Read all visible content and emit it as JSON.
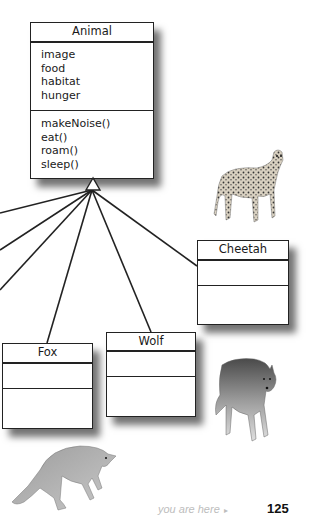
{
  "diagram": {
    "type": "UML class inheritance diagram",
    "superclass": {
      "name": "Animal",
      "attributes": [
        "image",
        "food",
        "habitat",
        "hunger"
      ],
      "methods": [
        "makeNoise()",
        "eat()",
        "roam()",
        "sleep()"
      ]
    },
    "subclasses": [
      {
        "name": "Cheetah",
        "attributes": [],
        "methods": []
      },
      {
        "name": "Fox",
        "attributes": [],
        "methods": []
      },
      {
        "name": "Wolf",
        "attributes": [],
        "methods": []
      }
    ],
    "offscreen_subclass_links": 3,
    "inheritance_arrow": "hollow-triangle"
  },
  "images": {
    "cheetah": "cheetah-photo",
    "wolf": "wolf-photo",
    "fox": "fox-photo"
  },
  "footer": {
    "you_are_here": "you are here",
    "arrow": "▸",
    "page_number": "125"
  },
  "colors": {
    "line": "#222222",
    "footer_gray": "#bdbdbd"
  }
}
